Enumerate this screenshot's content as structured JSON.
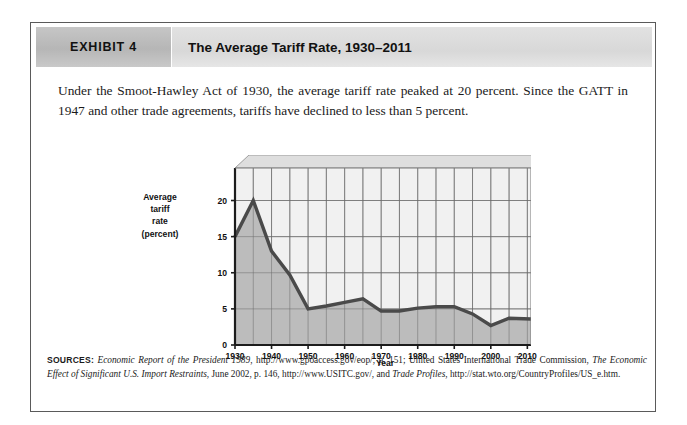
{
  "figure": {
    "exhibit_label": "EXHIBIT 4",
    "title": "The Average Tariff Rate, 1930–2011",
    "caption": "Under the Smoot-Hawley Act of 1930, the average tariff rate peaked at 20 percent. Since the GATT in 1947 and other trade agreements, tariffs have declined to less than 5 percent.",
    "sources_label": "SOURCES:",
    "sources_parts": [
      {
        "text": "Economic Report of the President 1989",
        "style": "italic"
      },
      {
        "text": ", http://www.gpoaccess.gov/eop/, p. 151; United States International Trade Commission, ",
        "style": "normal"
      },
      {
        "text": "The Economic Effect of Significant U.S. Import Restraints",
        "style": "italic"
      },
      {
        "text": ", June 2002, p. 146, http://www.USITC.gov/, and ",
        "style": "normal"
      },
      {
        "text": "Trade Profiles",
        "style": "italic"
      },
      {
        "text": ", http://stat.wto.org/CountryProfiles/US_e.htm.",
        "style": "normal"
      }
    ],
    "colors": {
      "tag_background": "#bcbcbc",
      "title_background": "#dcdcdc",
      "plot_background": "#f2f2f2",
      "area_fill": "#bdbdbd",
      "line": "#4a4a4a",
      "border": "#5a5a5a"
    }
  },
  "chart_data": {
    "type": "line",
    "title": "The Average Tariff Rate, 1930–2011",
    "xlabel": "Year",
    "ylabel": "Average tariff rate (percent)",
    "ylabel_lines": [
      "Average",
      "tariff",
      "rate",
      "(percent)"
    ],
    "xlim": [
      1930,
      2011
    ],
    "ylim": [
      0,
      24.5
    ],
    "yticks": [
      0,
      5,
      10,
      15,
      20
    ],
    "ytick_labels": [
      "0",
      "5",
      "10",
      "15",
      "20"
    ],
    "xticks": [
      1930,
      1940,
      1950,
      1960,
      1970,
      1980,
      1990,
      2000,
      2010
    ],
    "xtick_labels": [
      "1930",
      "1940",
      "1950",
      "1960",
      "1970",
      "1980",
      "1990",
      "2000",
      "2010"
    ],
    "x_gridlines": [
      1930,
      1935,
      1940,
      1945,
      1950,
      1955,
      1960,
      1965,
      1970,
      1975,
      1980,
      1985,
      1990,
      1995,
      2000,
      2005,
      2010
    ],
    "y_gridlines": [
      0,
      5,
      10,
      15,
      20
    ],
    "grid": true,
    "legend": "none",
    "fill_to_zero": true,
    "series": [
      {
        "name": "Average tariff rate (percent)",
        "x": [
          1930,
          1935,
          1940,
          1945,
          1950,
          1955,
          1960,
          1965,
          1970,
          1975,
          1980,
          1985,
          1990,
          1995,
          2000,
          2005,
          2011
        ],
        "values": [
          15.0,
          20.0,
          13.0,
          9.7,
          5.0,
          5.4,
          5.9,
          6.4,
          4.7,
          4.7,
          5.1,
          5.3,
          5.3,
          4.3,
          2.7,
          3.7,
          3.6
        ]
      }
    ],
    "annotations": [
      "Peak of 20 percent in 1935 following the Smoot-Hawley Act of 1930",
      "Declines to less than 5 percent after the GATT in 1947"
    ]
  }
}
